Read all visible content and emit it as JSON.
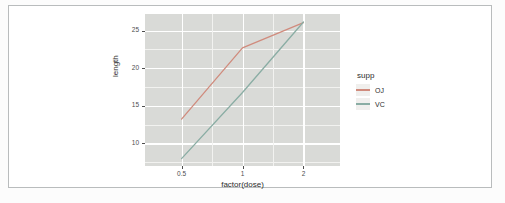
{
  "chart_data": {
    "type": "line",
    "title": "",
    "xlabel": "factor(dose)",
    "ylabel": "length",
    "categories": [
      "0.5",
      "1",
      "2"
    ],
    "x_tick_labels": [
      "0.5",
      "1",
      "2"
    ],
    "y_tick_labels": [
      "10",
      "15",
      "20",
      "25"
    ],
    "y_ticks": [
      10,
      15,
      20,
      25
    ],
    "ylim": [
      7.0,
      27.2
    ],
    "grid": true,
    "legend_position": "right",
    "legend_title": "supp",
    "series": [
      {
        "name": "OJ",
        "color": "#d08b7d",
        "values": [
          13.23,
          22.7,
          26.06
        ]
      },
      {
        "name": "VC",
        "color": "#8aada4",
        "values": [
          7.98,
          16.77,
          26.14
        ]
      }
    ]
  },
  "plot": {
    "panel_fill": "#d9dad7",
    "grid_major_color": "#ffffff",
    "grid_minor_color": "#f2f2f0",
    "legend_key_fill": "#f0efed",
    "axis_text_color": "#4d4d4d"
  },
  "legend": {
    "title": "supp",
    "items": [
      {
        "label": "OJ",
        "color": "#d08b7d"
      },
      {
        "label": "VC",
        "color": "#8aada4"
      }
    ]
  },
  "axes": {
    "x_title": "factor(dose)",
    "y_title": "length"
  }
}
